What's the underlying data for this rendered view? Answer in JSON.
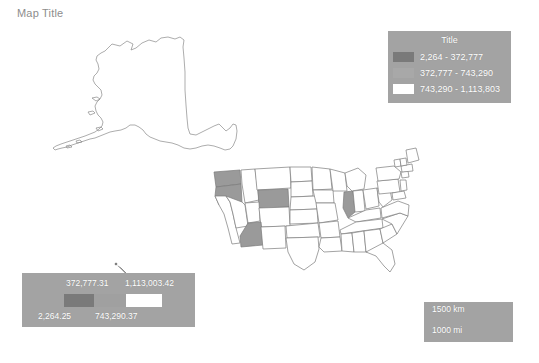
{
  "map": {
    "title": "Map Title",
    "background_color": "#ffffff",
    "title_color": "#8d8d8d",
    "state_outline_color": "#7b7b7b",
    "state_default_fill": "#ffffff",
    "state_highlight_fill": "#9a9a9a",
    "highlighted_states": [
      "Washington",
      "Oregon",
      "Wyoming",
      "Arizona",
      "Illinois"
    ]
  },
  "legend": {
    "title": "Title",
    "panel_color": "#a3a3a3",
    "text_color": "#ffffff",
    "items": [
      {
        "swatch_color": "#7a7a7a",
        "label": "2,264 - 372,777"
      },
      {
        "swatch_color": "#a8a8a8",
        "label": "372,777 - 743,290"
      },
      {
        "swatch_color": "#ffffff",
        "label": "743,290 - 1,113,803"
      }
    ]
  },
  "continuous_legend": {
    "panel_color": "#a3a3a3",
    "text_color": "#ffffff",
    "top_labels": [
      "372,777.31",
      "1,113,003.42"
    ],
    "bottom_labels": [
      "2,264.25",
      "743,290.37"
    ],
    "segments": [
      {
        "color": "#7a7a7a"
      },
      {
        "color": "#a0a0a0"
      },
      {
        "color": "#ffffff"
      }
    ]
  },
  "scalebar": {
    "panel_color": "#a3a3a3",
    "text_color": "#ffffff",
    "km_label": "1500 km",
    "mi_label": "1000 mi"
  }
}
